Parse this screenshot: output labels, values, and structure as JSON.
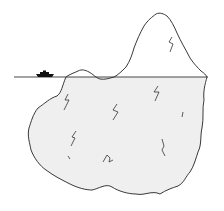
{
  "illustration": {
    "subject": "iceberg",
    "description": "Iceberg with small tip above waterline and large mass below, ship on the water",
    "elements": [
      "waterline",
      "ship",
      "iceberg-tip",
      "iceberg-submerged",
      "crack-marks"
    ],
    "colors": {
      "background": "#ffffff",
      "outline": "#222222",
      "underwater_shade": "#eeeeee",
      "ship": "#111111"
    }
  }
}
